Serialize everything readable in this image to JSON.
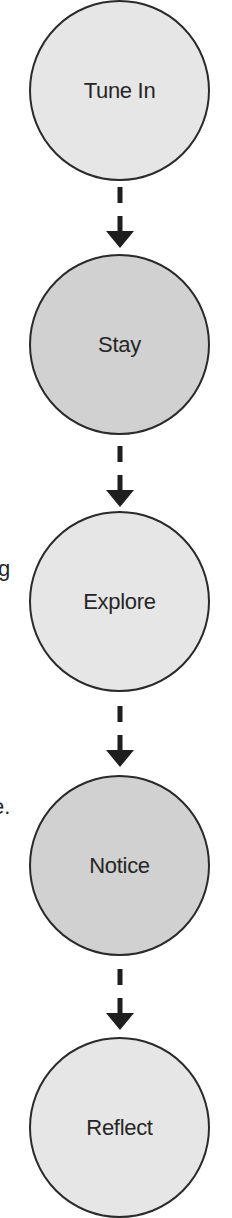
{
  "diagram": {
    "type": "vertical-flow",
    "colors": {
      "light_fill": "#e6e6e6",
      "dark_fill": "#d1d1d1",
      "stroke": "#2a2a2a",
      "text": "#262626",
      "arrow": "#1e1e1e"
    },
    "nodes": [
      {
        "id": "tune-in",
        "label": "Tune In",
        "shade": "light"
      },
      {
        "id": "stay",
        "label": "Stay",
        "shade": "dark"
      },
      {
        "id": "explore",
        "label": "Explore",
        "shade": "light"
      },
      {
        "id": "notice",
        "label": "Notice",
        "shade": "dark"
      },
      {
        "id": "reflect",
        "label": "Reflect",
        "shade": "light"
      }
    ],
    "edges": [
      {
        "from": "tune-in",
        "to": "stay",
        "style": "dashed-arrow"
      },
      {
        "from": "stay",
        "to": "explore",
        "style": "dashed-arrow"
      },
      {
        "from": "explore",
        "to": "notice",
        "style": "dashed-arrow"
      },
      {
        "from": "notice",
        "to": "reflect",
        "style": "dashed-arrow"
      }
    ],
    "clipped_text_fragments": [
      {
        "text": "g"
      },
      {
        "text": "e."
      }
    ]
  }
}
